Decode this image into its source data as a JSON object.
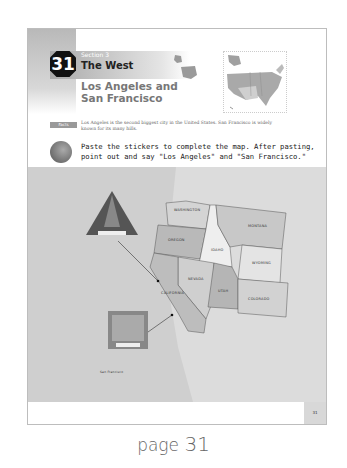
{
  "lesson": {
    "number": "31",
    "section_label": "Section 3",
    "region": "The West",
    "title": "Los Angeles and San Francisco"
  },
  "facts": {
    "tag": "Facts",
    "text": "Los Angeles is the second biggest city in the United States. San Francisco is widely known for its many hills."
  },
  "instruction": "Paste the stickers to complete the map. After pasting, point out and say \"Los Angeles\" and \"San Francisco.\"",
  "map": {
    "states": [
      {
        "name": "WASHINGTON"
      },
      {
        "name": "OREGON"
      },
      {
        "name": "IDAHO"
      },
      {
        "name": "MONTANA"
      },
      {
        "name": "WYOMING"
      },
      {
        "name": "NEVADA"
      },
      {
        "name": "UTAH"
      },
      {
        "name": "COLORADO"
      },
      {
        "name": "CALIFORNIA"
      }
    ],
    "stickers": [
      {
        "label": "San Francisco"
      },
      {
        "label": "Los Angeles"
      }
    ]
  },
  "footer": {
    "page_number": "31"
  },
  "caption": {
    "prefix": "page",
    "number": "31"
  }
}
